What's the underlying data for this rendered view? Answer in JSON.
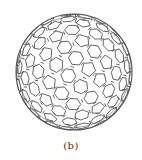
{
  "figure": {
    "caption": "(b)",
    "line_color": "#555555",
    "background": "#ffffff",
    "sphere": {
      "cx": 74,
      "cy": 72,
      "r": 58
    }
  }
}
